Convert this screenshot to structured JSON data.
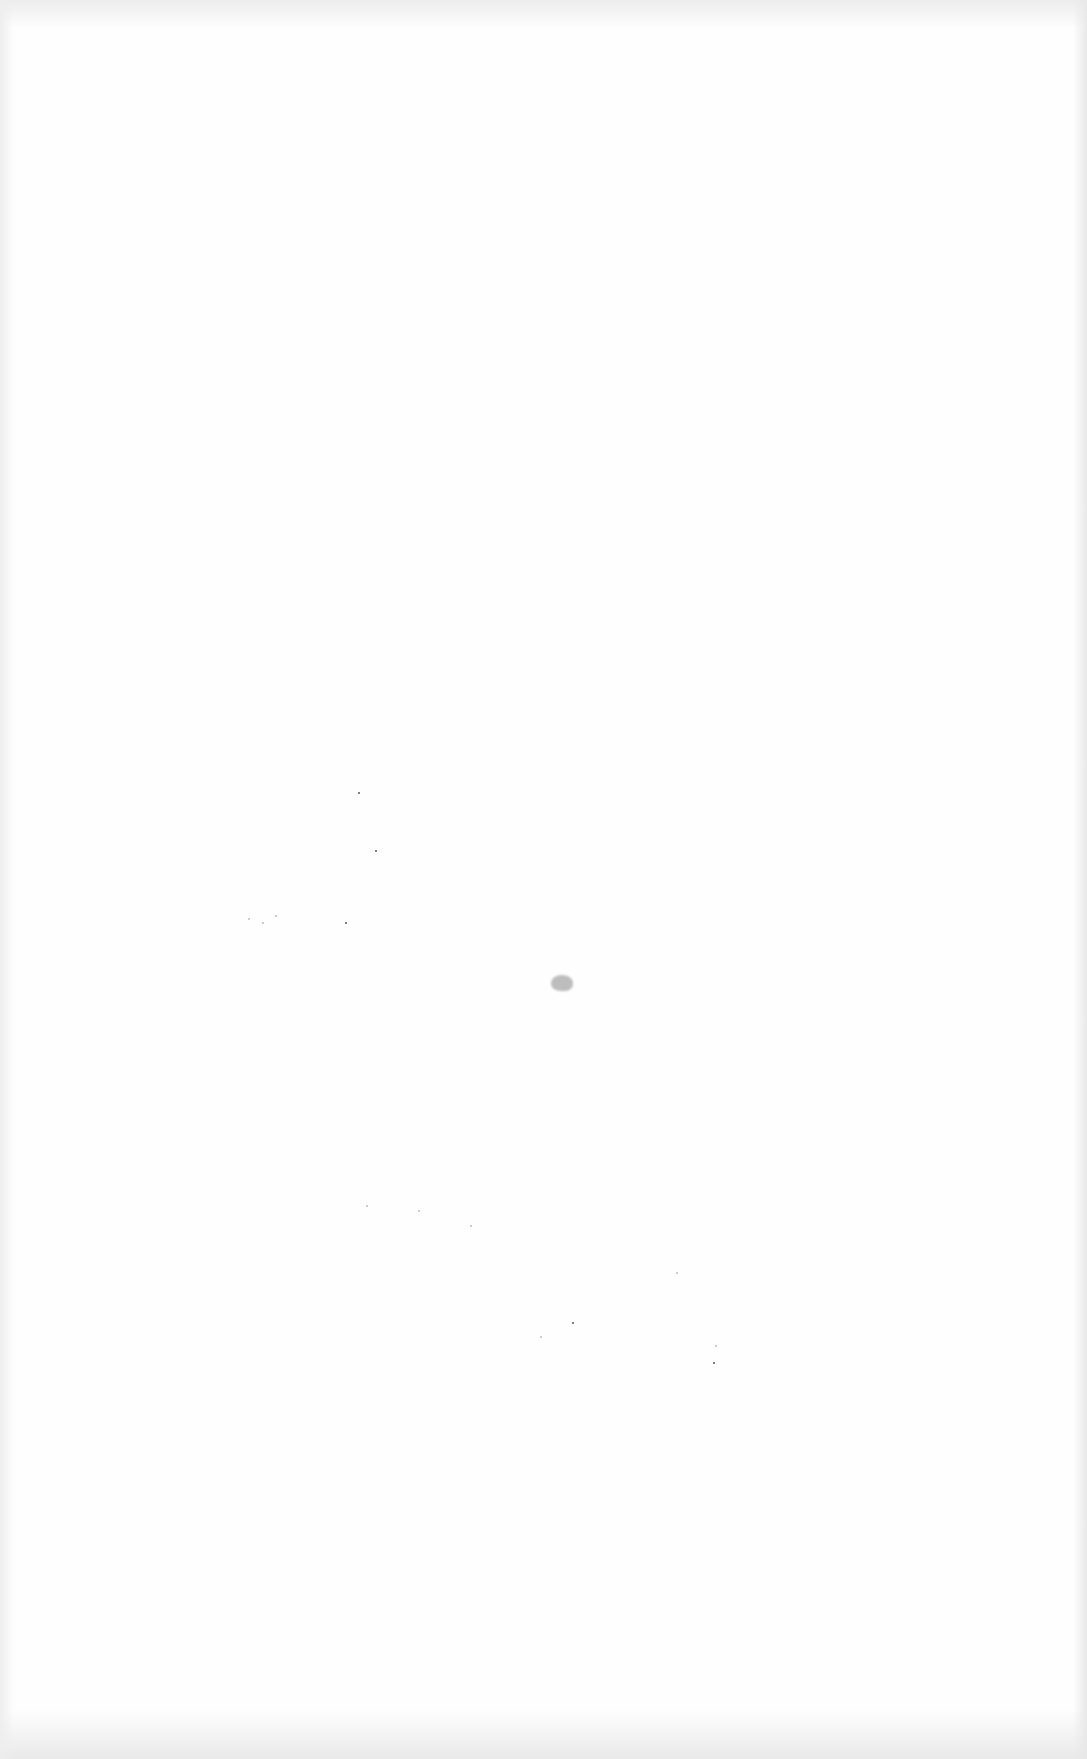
{
  "page": {
    "kind": "blank scanned page",
    "visible_text": []
  }
}
